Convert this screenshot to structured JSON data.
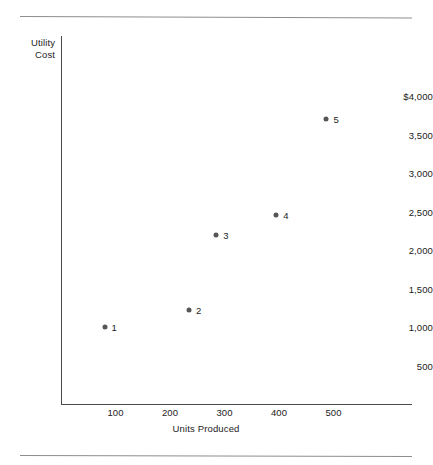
{
  "figure": {
    "background_color": "#ffffff",
    "rule_color": "#8d8d8d",
    "axis_color": "#4a4a4a",
    "marker_color": "#565656",
    "text_color": "#222222"
  },
  "chart_data": {
    "type": "scatter",
    "title": "",
    "xlabel": "Units Produced",
    "ylabel": "Utility Cost",
    "ylabel_lines": [
      "Utility",
      "Cost"
    ],
    "xlim": [
      0,
      645
    ],
    "ylim": [
      0,
      4260
    ],
    "grid": false,
    "legend": "none",
    "xticks": [
      100,
      200,
      300,
      400,
      500
    ],
    "xticklabels": [
      "100",
      "200",
      "300",
      "400",
      "500"
    ],
    "yticks": [
      500,
      1000,
      1500,
      2000,
      2500,
      3000,
      3500,
      4000
    ],
    "yticklabels": [
      "500",
      "1,000",
      "1,500",
      "2,000",
      "2,500",
      "3,000",
      "3,500",
      "$4,000"
    ],
    "point_labels": [
      "1",
      "2",
      "3",
      "4",
      "5"
    ],
    "x": [
      80,
      235,
      285,
      395,
      487
    ],
    "y": [
      1000,
      1225,
      2200,
      2450,
      3700
    ],
    "points": [
      {
        "label": "1",
        "x": 80,
        "y": 1000
      },
      {
        "label": "2",
        "x": 235,
        "y": 1225
      },
      {
        "label": "3",
        "x": 285,
        "y": 2200
      },
      {
        "label": "4",
        "x": 395,
        "y": 2450
      },
      {
        "label": "5",
        "x": 487,
        "y": 3700
      }
    ]
  }
}
